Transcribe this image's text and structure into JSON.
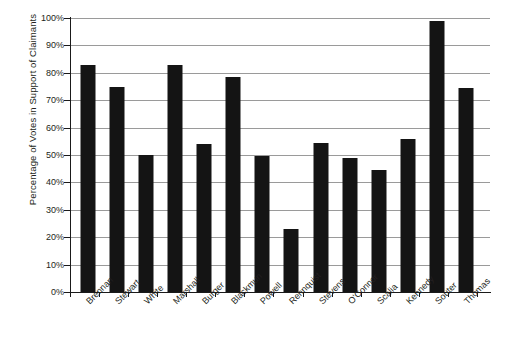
{
  "chart_data": {
    "type": "bar",
    "title": "",
    "xlabel": "",
    "ylabel": "Percentage of Votes in Support of Claimants",
    "ylim": [
      0,
      100
    ],
    "ytick_labels": [
      "100%",
      "90%",
      "80%",
      "70%",
      "60%",
      "50%",
      "40%",
      "30%",
      "20%",
      "10%",
      "0%"
    ],
    "ytick_values": [
      100,
      90,
      80,
      70,
      60,
      50,
      40,
      30,
      20,
      10,
      0
    ],
    "grid": "horizontal",
    "legend": "none",
    "bar_color": "#141414",
    "grid_color": "#9a9a9a",
    "axis_color": "#1a1a1a",
    "background": "#ffffff",
    "categories": [
      "Brennan",
      "Stewart",
      "White",
      "Marshall",
      "Burger",
      "Blackmun",
      "Powell",
      "Rehnquist",
      "Stevens",
      "O'Connor",
      "Scalia",
      "Kennedy",
      "Souter",
      "Thomas"
    ],
    "values": [
      83,
      75,
      50,
      83,
      54,
      78.5,
      49.5,
      23,
      54.5,
      49,
      44.5,
      56,
      99,
      74.5
    ]
  }
}
